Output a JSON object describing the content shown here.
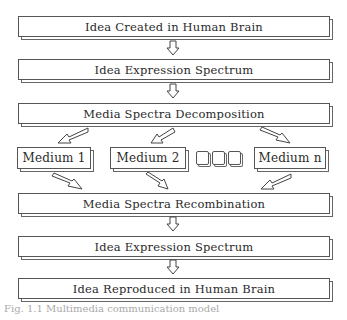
{
  "diagram": {
    "steps": [
      {
        "id": "idea-created",
        "label": "Idea Created in Human Brain"
      },
      {
        "id": "expression-1",
        "label": "Idea Expression Spectrum"
      },
      {
        "id": "decomposition",
        "label": "Media Spectra Decomposition"
      },
      {
        "id": "recombination",
        "label": "Media Spectra Recombination"
      },
      {
        "id": "expression-2",
        "label": "Idea Expression Spectrum"
      },
      {
        "id": "idea-reproduced",
        "label": "Idea Reproduced in Human Brain"
      }
    ],
    "media": [
      {
        "label": "Medium 1"
      },
      {
        "label": "Medium 2"
      },
      {
        "label": "Medium n"
      }
    ],
    "ellipsis_squares": 3,
    "arrow_icon": "hollow-down-arrow",
    "caption": "Fig. 1.1 Multimedia communication model"
  }
}
